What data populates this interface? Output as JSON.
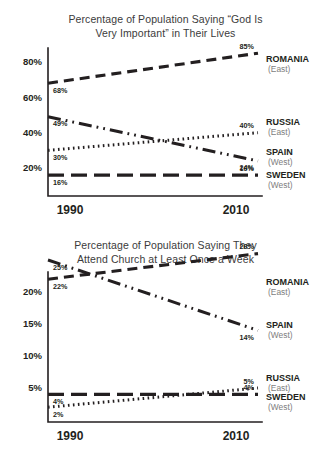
{
  "chart_data": [
    {
      "id": "god-important",
      "type": "line",
      "title_lines": [
        "Percentage of Population Saying “God Is",
        "Very Important” in Their Lives"
      ],
      "title": "Percentage of Population Saying “God Is Very Important” in Their Lives",
      "xlabel": "",
      "ylabel": "",
      "x": [
        1990,
        2010
      ],
      "xtick_labels": [
        "1990",
        "2010"
      ],
      "ylim": [
        10,
        90
      ],
      "yticks": [
        20,
        40,
        60,
        80
      ],
      "ytick_labels": [
        "20%",
        "40%",
        "60%",
        "80%"
      ],
      "grid": false,
      "legend_position": "right",
      "series": [
        {
          "name": "ROMANIA",
          "region": "(East)",
          "values": [
            68,
            85
          ],
          "start_label": "68%",
          "end_label": "85%",
          "dash": "10,6",
          "width": 3.1
        },
        {
          "name": "RUSSIA",
          "region": "(East)",
          "values": [
            30,
            40
          ],
          "start_label": "30%",
          "end_label": "40%",
          "dash": "1.6,3.4",
          "width": 3.0
        },
        {
          "name": "SPAIN",
          "region": "(West)",
          "values": [
            49,
            24
          ],
          "start_label": "49%",
          "end_label": "24%",
          "dash": "13,5,1.8,5,1.8,5",
          "width": 3.0
        },
        {
          "name": "SWEDEN",
          "region": "(West)",
          "values": [
            16,
            16
          ],
          "start_label": "16%",
          "end_label": "16%",
          "dash": "16,7",
          "width": 3.2
        }
      ]
    },
    {
      "id": "church-attendance",
      "type": "line",
      "title_lines": [
        "Percentage of Population Saying They",
        "Attend Church at Least Once a Week"
      ],
      "title": "Percentage of Population Saying They Attend Church at Least Once a Week",
      "xlabel": "",
      "ylabel": "",
      "x": [
        1990,
        2010
      ],
      "xtick_labels": [
        "1990",
        "2010"
      ],
      "ylim": [
        1,
        27.5
      ],
      "yticks": [
        5,
        10,
        15,
        20
      ],
      "ytick_labels": [
        "5%",
        "10%",
        "15%",
        "20%"
      ],
      "grid": false,
      "legend_position": "right",
      "series": [
        {
          "name": "ROMANIA",
          "region": "(East)",
          "values": [
            22,
            26
          ],
          "start_label": "22%",
          "end_label": "26%",
          "dash": "10,6",
          "width": 3.1
        },
        {
          "name": "SPAIN",
          "region": "(West)",
          "values": [
            25,
            14
          ],
          "start_label": "25%",
          "end_label": "14%",
          "dash": "13,5,1.8,5,1.8,5",
          "width": 3.0
        },
        {
          "name": "RUSSIA",
          "region": "(East)",
          "values": [
            2,
            5
          ],
          "start_label": "2%",
          "end_label": "5%",
          "dash": "1.6,3.4",
          "width": 3.0
        },
        {
          "name": "SWEDEN",
          "region": "(West)",
          "values": [
            4,
            4
          ],
          "start_label": "4%",
          "end_label": "4%",
          "dash": "16,7",
          "width": 3.2
        }
      ]
    }
  ],
  "style": {
    "ink": "#231f20",
    "muted": "#7d7d7d",
    "background": "#ffffff"
  }
}
